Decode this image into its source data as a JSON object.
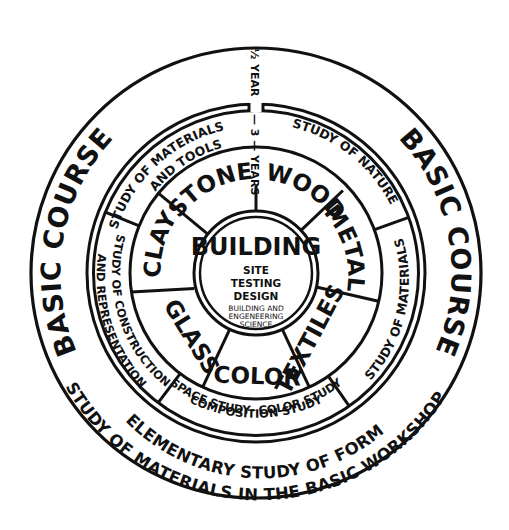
{
  "diagram": {
    "colors": {
      "ink": "#111111",
      "paper": "#ffffff"
    },
    "outer_band": {
      "left_label": "BASIC COURSE",
      "right_label": "BASIC COURSE",
      "bottom_line_1": "ELEMENTARY STUDY OF FORM",
      "bottom_line_2": "STUDY OF MATERIALS IN THE BASIC WORKSHOP"
    },
    "duration": {
      "half": "½",
      "basic_year": "YEAR",
      "dash_3": "— 3 —",
      "years": "YEARS"
    },
    "study_ring": [
      {
        "line1": "STUDY OF MATERIALS",
        "line2": "AND TOOLS"
      },
      {
        "line1": "STUDY OF NATURE"
      },
      {
        "line1": "STUDY OF MATERIALS"
      },
      {
        "line1": "SPACE STUDY· COLOR STUDY",
        "line2": "COMPOSITION STUDY"
      },
      {
        "line1": "STUDY OF CONSTRUCTION",
        "line2": "AND REPRESENTATION"
      }
    ],
    "materials_ring": [
      "STONE",
      "WOOD",
      "METAL",
      "TEXTILES",
      "COLOR",
      "GLASS",
      "CLAY"
    ],
    "center": {
      "title": "BUILDING",
      "items": [
        "SITE",
        "TESTING",
        "DESIGN"
      ],
      "science_line_1": "BUILDING AND",
      "science_line_2": "ENGENEERING",
      "science_line_3": "SCIENCE"
    }
  }
}
